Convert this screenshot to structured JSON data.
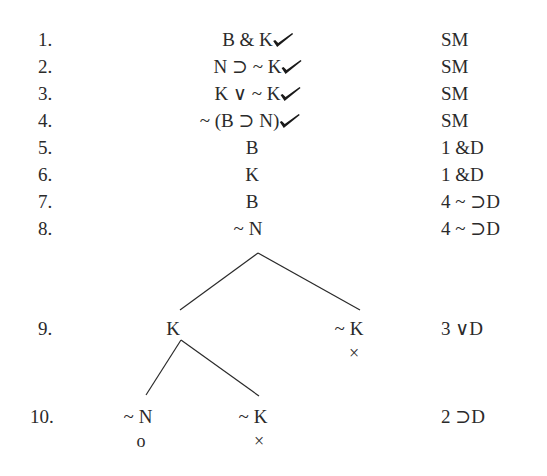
{
  "rows": [
    {
      "num": "1.",
      "formula": "B & K",
      "checked": true,
      "just": "SM"
    },
    {
      "num": "2.",
      "formula": "N ⊃ ~ K",
      "checked": true,
      "just": "SM"
    },
    {
      "num": "3.",
      "formula": "K ∨ ~ K",
      "checked": true,
      "just": "SM"
    },
    {
      "num": "4.",
      "formula": "~ (B ⊃ N)",
      "checked": true,
      "just": "SM"
    },
    {
      "num": "5.",
      "formula": "B",
      "checked": false,
      "just": "1 &D"
    },
    {
      "num": "6.",
      "formula": "K",
      "checked": false,
      "just": "1 &D"
    },
    {
      "num": "7.",
      "formula": "B",
      "checked": false,
      "just": "4 ~ ⊃D"
    },
    {
      "num": "8.",
      "formula": "~ N",
      "checked": false,
      "just": "4 ~ ⊃D"
    }
  ],
  "branch_rows": [
    {
      "num": "9.",
      "nodes": [
        {
          "formula": "K",
          "mark": ""
        },
        {
          "formula": "~ K",
          "mark": "×"
        }
      ],
      "just": "3 ∨D"
    },
    {
      "num": "10.",
      "nodes": [
        {
          "formula": "~ N",
          "mark": "o"
        },
        {
          "formula": "~ K",
          "mark": "×"
        }
      ],
      "just": "2 ⊃D"
    }
  ],
  "colors": {
    "ink": "#2a2a2a",
    "background": "#ffffff"
  }
}
